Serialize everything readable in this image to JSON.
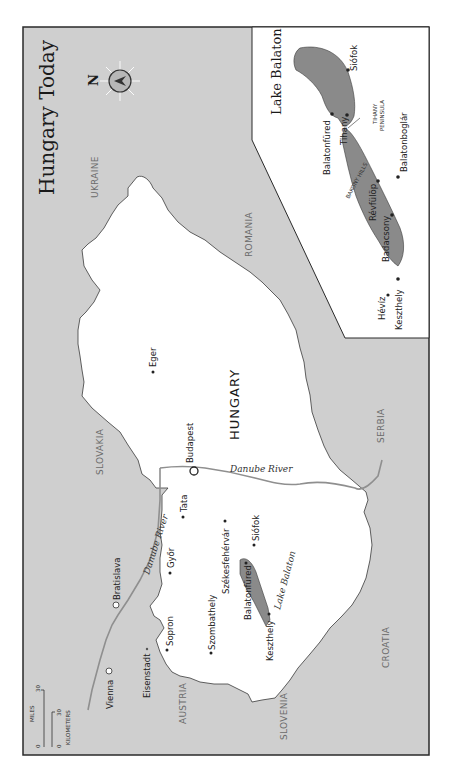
{
  "title": "Hungary Today",
  "compass": {
    "label": "N",
    "icon": "compass-rose-icon"
  },
  "countries": {
    "hungary": "HUNGARY",
    "ukraine": "UKRAINE",
    "romania": "ROMANIA",
    "slovakia": "SLOVAKIA",
    "serbia": "SERBIA",
    "croatia": "CROATIA",
    "slovenia": "SLOVENIA",
    "austria": "AUSTRIA"
  },
  "cities": {
    "budapest": "Budapest",
    "eger": "Eger",
    "tata": "Tata",
    "gyor": "Győr",
    "szekesfehervar": "Székesfehérvár",
    "siofok": "Siófok",
    "balatonfured": "Balatonfüred",
    "keszthely": "Keszthely",
    "szombathely": "Szombathely",
    "sopron": "Sopron",
    "bratislava": "Bratislava",
    "vienna": "Vienna",
    "eisenstadt": "Eisenstadt"
  },
  "rivers": {
    "danube_main": "Danube River",
    "danube_west": "Danube River",
    "lake_balaton": "Lake Balaton"
  },
  "inset": {
    "title": "Lake Balaton",
    "places": {
      "siofok": "Siófok",
      "tihany_peninsula_1": "TIHANY",
      "tihany_peninsula_2": "PENINSULA",
      "balatonfured": "Balatonfüred",
      "tihany": "Tihany",
      "balatonboglar": "Balatonboglár",
      "revfulop": "Révfülöp",
      "bakony_hills": "BAKONY HILLS",
      "badacsony": "Badacsony",
      "heviz": "Hévíz",
      "keszthely": "Keszthely"
    }
  },
  "scale": {
    "miles_label": "MILES",
    "miles_zero": "0",
    "miles_max": "30",
    "km_label": "KILOMETERS",
    "km_zero": "0",
    "km_max": "30"
  },
  "colors": {
    "land_neighbor": "#cfcfcf",
    "land_hungary": "#ffffff",
    "lake": "#8a8a8a",
    "border": "#3a3a3a",
    "river": "#8f8f8f",
    "frame": "#2a2a2a"
  }
}
